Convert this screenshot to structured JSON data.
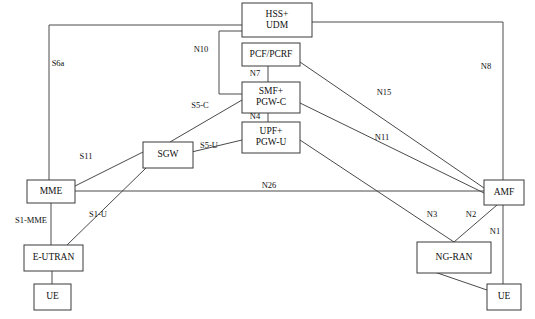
{
  "diagram": {
    "type": "network-reference-architecture",
    "colors": {
      "background": "#ffffff",
      "box_stroke": "#3a3a3a",
      "link_stroke": "#4a4a4a",
      "text": "#101010"
    },
    "nodes": [
      {
        "id": "hss-udm",
        "label_lines": [
          "HSS+",
          "UDM"
        ],
        "x": 242,
        "y": 3,
        "w": 70,
        "h": 34
      },
      {
        "id": "pcf-pcrf",
        "label_lines": [
          "PCF/PCRF"
        ],
        "x": 242,
        "y": 43,
        "w": 58,
        "h": 23
      },
      {
        "id": "smf-pgwc",
        "label_lines": [
          "SMF+",
          "PGW-C"
        ],
        "x": 242,
        "y": 82,
        "w": 58,
        "h": 31
      },
      {
        "id": "upf-pgwu",
        "label_lines": [
          "UPF+",
          "PGW-U"
        ],
        "x": 242,
        "y": 122,
        "w": 58,
        "h": 31
      },
      {
        "id": "sgw",
        "label_lines": [
          "SGW"
        ],
        "x": 143,
        "y": 142,
        "w": 50,
        "h": 26
      },
      {
        "id": "mme",
        "label_lines": [
          "MME"
        ],
        "x": 27,
        "y": 180,
        "w": 48,
        "h": 23
      },
      {
        "id": "e-utran",
        "label_lines": [
          "E-UTRAN"
        ],
        "x": 24,
        "y": 245,
        "w": 59,
        "h": 26
      },
      {
        "id": "ue-left",
        "label_lines": [
          "UE"
        ],
        "x": 34,
        "y": 284,
        "w": 37,
        "h": 26
      },
      {
        "id": "amf",
        "label_lines": [
          "AMF"
        ],
        "x": 484,
        "y": 180,
        "w": 40,
        "h": 25
      },
      {
        "id": "ng-ran",
        "label_lines": [
          "NG-RAN"
        ],
        "x": 417,
        "y": 242,
        "w": 74,
        "h": 31
      },
      {
        "id": "ue-right",
        "label_lines": [
          "UE"
        ],
        "x": 487,
        "y": 284,
        "w": 34,
        "h": 26
      }
    ],
    "edge_labels": [
      {
        "id": "s6a",
        "text": "S6a",
        "x": 58,
        "y": 64
      },
      {
        "id": "n10",
        "text": "N10",
        "x": 201,
        "y": 50
      },
      {
        "id": "n8",
        "text": "N8",
        "x": 486,
        "y": 67
      },
      {
        "id": "n7",
        "text": "N7",
        "x": 255,
        "y": 74
      },
      {
        "id": "n15",
        "text": "N15",
        "x": 384,
        "y": 93
      },
      {
        "id": "s5c",
        "text": "S5-C",
        "x": 200,
        "y": 106
      },
      {
        "id": "n4",
        "text": "N4",
        "x": 255,
        "y": 117
      },
      {
        "id": "n11",
        "text": "N11",
        "x": 382,
        "y": 138
      },
      {
        "id": "s5u",
        "text": "S5-U",
        "x": 209,
        "y": 146
      },
      {
        "id": "s11",
        "text": "S11",
        "x": 86,
        "y": 157
      },
      {
        "id": "n26",
        "text": "N26",
        "x": 269,
        "y": 186
      },
      {
        "id": "s1mme",
        "text": "S1-MME",
        "x": 31,
        "y": 221
      },
      {
        "id": "s1u",
        "text": "S1-U",
        "x": 98,
        "y": 215
      },
      {
        "id": "n3",
        "text": "N3",
        "x": 432,
        "y": 215
      },
      {
        "id": "n2",
        "text": "N2",
        "x": 471,
        "y": 215
      },
      {
        "id": "n1",
        "text": "N1",
        "x": 495,
        "y": 232
      }
    ],
    "links": [
      {
        "id": "link-s6a-top",
        "from": "mme",
        "to": "hss-udm",
        "points": "49,203 49,25 242,25"
      },
      {
        "id": "link-n8-right",
        "from": "hss-udm",
        "to": "amf",
        "points": "312,22 503,22 503,190"
      },
      {
        "id": "link-n10",
        "from": "smf-pgwc",
        "to": "hss-udm",
        "points": "242,94 219,94 219,31 242,31"
      },
      {
        "id": "link-n7",
        "from": "pcf-pcrf",
        "to": "smf-pgwc",
        "points": "268,66 268,82"
      },
      {
        "id": "link-n4",
        "from": "smf-pgwc",
        "to": "upf-pgwu",
        "points": "268,113 268,122"
      },
      {
        "id": "link-n15",
        "from": "pcf-pcrf",
        "to": "amf",
        "points": "300,62 484,188"
      },
      {
        "id": "link-n11",
        "from": "smf-pgwc",
        "to": "amf",
        "points": "300,103 484,193"
      },
      {
        "id": "link-s5c",
        "from": "sgw",
        "to": "smf-pgwc",
        "points": "170,142 242,100"
      },
      {
        "id": "link-s5u",
        "from": "sgw",
        "to": "upf-pgwu",
        "points": "179,155 242,140"
      },
      {
        "id": "link-s11",
        "from": "mme",
        "to": "sgw",
        "points": "75,186 143,152"
      },
      {
        "id": "link-n26",
        "from": "mme",
        "to": "amf",
        "points": "75,191 484,191"
      },
      {
        "id": "link-s1mme",
        "from": "mme",
        "to": "e-utran",
        "points": "51,203 51,245"
      },
      {
        "id": "link-s1u",
        "from": "e-utran",
        "to": "sgw",
        "points": "67,245 146,168"
      },
      {
        "id": "link-ue-eutran",
        "from": "ue-left",
        "to": "e-utran",
        "points": "52,284 52,271"
      },
      {
        "id": "link-n3",
        "from": "upf-pgwu",
        "to": "ng-ran",
        "points": "300,140 454,242"
      },
      {
        "id": "link-n2",
        "from": "ng-ran",
        "to": "amf",
        "points": "454,242 497,205"
      },
      {
        "id": "link-n1",
        "from": "ue-right",
        "to": "amf",
        "points": "503,284 503,205"
      },
      {
        "id": "link-ue-ngran",
        "from": "ng-ran",
        "to": "ue-right",
        "points": "417,266 487,290"
      }
    ]
  }
}
